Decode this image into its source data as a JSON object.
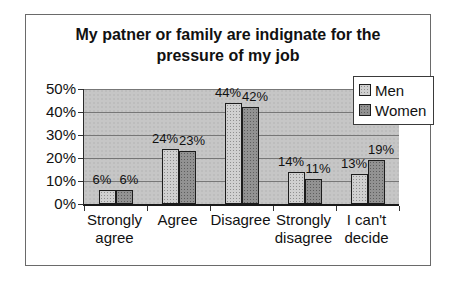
{
  "chart": {
    "title": "My patner or family are indignate for the pressure of my job"
  },
  "chart_data": {
    "type": "bar",
    "title": "My patner or family are indignate for the pressure of my job",
    "categories": [
      "Strongly agree",
      "Agree",
      "Disagree",
      "Strongly disagree",
      "I can't decide"
    ],
    "series": [
      {
        "name": "Men",
        "values": [
          6,
          24,
          44,
          14,
          13
        ]
      },
      {
        "name": "Women",
        "values": [
          6,
          23,
          42,
          11,
          19
        ]
      }
    ],
    "data_labels": [
      [
        "6%",
        "24%",
        "44%",
        "14%",
        "13%"
      ],
      [
        "6%",
        "23%",
        "42%",
        "11%",
        "19%"
      ]
    ],
    "xlabel": "",
    "ylabel": "",
    "ylim": [
      0,
      50
    ],
    "ytick_step": 10,
    "yticks": [
      "0%",
      "10%",
      "20%",
      "30%",
      "40%",
      "50%"
    ],
    "grid": true,
    "legend_position": "top-right",
    "colors": {
      "men_fill": "#d0d0d0",
      "women_fill": "#929292",
      "plot_background": "#c6c6c6",
      "gridline": "#777777"
    }
  }
}
